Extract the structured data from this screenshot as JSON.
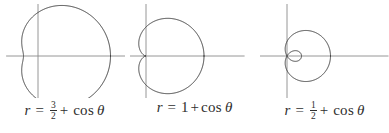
{
  "figure": {
    "background_color": "#ffffff",
    "curve_color": "#3b3b3b",
    "axis_color": "#8a8a8a",
    "text_color": "#2e2e2e"
  },
  "panels": [
    {
      "id": "panel-1",
      "caption": {
        "lhs": "r",
        "equals": "=",
        "constant_kind": "fraction",
        "numerator": "3",
        "denominator": "2",
        "plus": "+",
        "func": "cos",
        "angle": "θ",
        "full_text": "r = 3/2 + cos θ"
      }
    },
    {
      "id": "panel-2",
      "caption": {
        "lhs": "r",
        "equals": "=",
        "constant_kind": "whole",
        "whole": "1",
        "plus": "+",
        "func": "cos",
        "angle": "θ",
        "full_text": "r = 1 + cos θ"
      }
    },
    {
      "id": "panel-3",
      "caption": {
        "lhs": "r",
        "equals": "=",
        "constant_kind": "fraction",
        "numerator": "1",
        "denominator": "2",
        "plus": "+",
        "func": "cos",
        "angle": "θ",
        "full_text": "r = 1/2 + cos θ"
      }
    }
  ],
  "chart_data": [
    {
      "type": "line",
      "title": "r = 3/2 + cos θ",
      "coordinate_system": "polar",
      "equation": "r = 1.5 + cos(theta)",
      "a": 1.5,
      "b": 1.0,
      "shape": "convex limacon",
      "theta_range_deg": [
        0,
        360
      ],
      "r_max": 2.5,
      "r_min": 0.5,
      "grid": false,
      "legend": "none",
      "axes": {
        "x_axis_visible": true,
        "y_axis_visible": true,
        "origin_px": [
          38,
          52
        ],
        "scale_px_per_unit": 29,
        "xlim": [
          -1.1,
          3.0
        ],
        "ylim": [
          -1.8,
          1.8
        ]
      }
    },
    {
      "type": "line",
      "title": "r = 1 + cos θ",
      "coordinate_system": "polar",
      "equation": "r = 1 + cos(theta)",
      "a": 1.0,
      "b": 1.0,
      "shape": "cardioid",
      "theta_range_deg": [
        0,
        360
      ],
      "r_max": 2.0,
      "r_min": 0.0,
      "grid": false,
      "legend": "none",
      "axes": {
        "x_axis_visible": true,
        "y_axis_visible": true,
        "origin_px": [
          16,
          52
        ],
        "scale_px_per_unit": 29,
        "xlim": [
          -0.6,
          3.4
        ],
        "ylim": [
          -1.8,
          1.8
        ]
      }
    },
    {
      "type": "line",
      "title": "r = 1/2 + cos θ",
      "coordinate_system": "polar",
      "equation": "r = 0.5 + cos(theta)",
      "a": 0.5,
      "b": 1.0,
      "shape": "limacon with inner loop",
      "theta_range_deg": [
        0,
        360
      ],
      "r_max": 1.5,
      "r_min": -0.5,
      "grid": false,
      "legend": "none",
      "axes": {
        "x_axis_visible": true,
        "y_axis_visible": true,
        "origin_px": [
          27,
          52
        ],
        "scale_px_per_unit": 29,
        "xlim": [
          -0.95,
          3.5
        ],
        "ylim": [
          -1.8,
          1.8
        ]
      }
    }
  ]
}
